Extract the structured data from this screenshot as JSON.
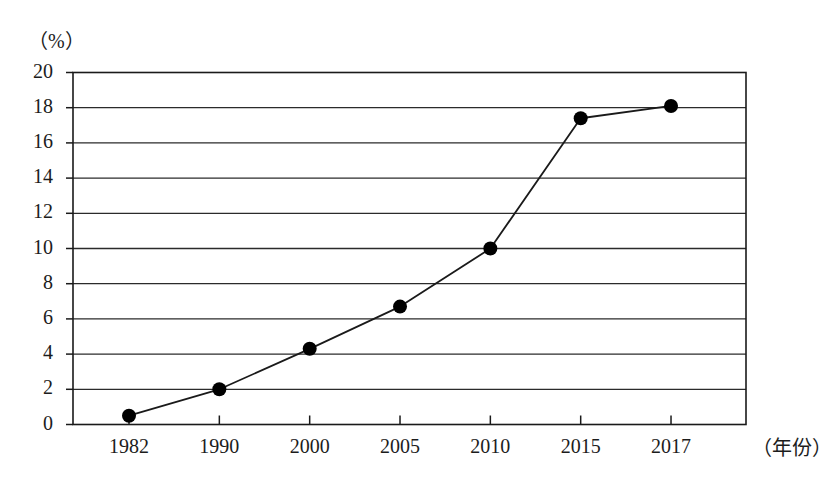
{
  "chart_data": {
    "type": "line",
    "title": "",
    "subtitle": "",
    "xlabel": "（年份）",
    "ylabel": "（%）",
    "categories": [
      "1982",
      "1990",
      "2000",
      "2005",
      "2010",
      "2015",
      "2017"
    ],
    "x": [
      1982,
      1990,
      2000,
      2005,
      2010,
      2015,
      2017
    ],
    "values": [
      0.5,
      2.0,
      4.3,
      6.7,
      10.0,
      17.4,
      18.1
    ],
    "series": [
      {
        "name": "",
        "values": [
          0.5,
          2.0,
          4.3,
          6.7,
          10.0,
          17.4,
          18.1
        ]
      }
    ],
    "ylim": [
      0,
      20
    ],
    "ytick_labels": [
      "0",
      "2",
      "4",
      "6",
      "8",
      "10",
      "12",
      "14",
      "16",
      "18",
      "20"
    ],
    "ytick_values": [
      0,
      2,
      4,
      6,
      8,
      10,
      12,
      14,
      16,
      18,
      20
    ],
    "xtick_labels": [
      "1982",
      "1990",
      "2000",
      "2005",
      "2010",
      "2015",
      "2017"
    ],
    "grid": true,
    "grid_axis": "y",
    "legend": false,
    "legend_position": "none",
    "marker": "filled-circle",
    "line_color": "#1a1a1a",
    "marker_color": "#000000",
    "grid_color": "#2b2b2b",
    "axis_color": "#1a1a1a",
    "background_color": "#ffffff",
    "annotations": []
  },
  "axes": {
    "y_unit_label": "（%）",
    "x_unit_label": "（年份）"
  }
}
